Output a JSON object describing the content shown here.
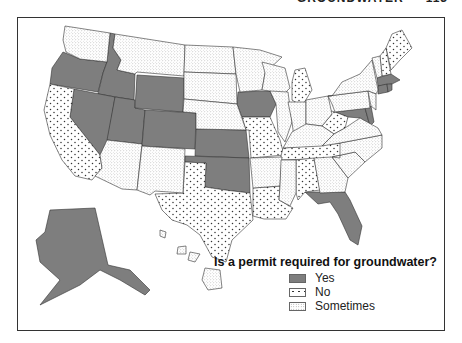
{
  "page_header": {
    "text": "GROUNDWATER",
    "page_number": "113"
  },
  "legend": {
    "title": "Is a permit required for groundwater?",
    "items": [
      {
        "key": "yes",
        "label": "Yes",
        "color": "#7e7e7e",
        "pattern": "solid"
      },
      {
        "key": "no",
        "label": "No",
        "color": "#333333",
        "pattern": "sparse-dots"
      },
      {
        "key": "sometimes",
        "label": "Sometimes",
        "color": "#999999",
        "pattern": "fine-stipple"
      }
    ]
  },
  "states": {
    "yes": [
      "OR",
      "ID",
      "NV",
      "UT",
      "WY",
      "CO",
      "KS",
      "OK",
      "IA",
      "FL",
      "AK",
      "MA",
      "CT",
      "RI",
      "MD",
      "DE"
    ],
    "no": [
      "CA",
      "TX",
      "MO",
      "LA",
      "TN",
      "AL",
      "WV",
      "MI",
      "ME",
      "NH"
    ],
    "sometimes": [
      "WA",
      "MT",
      "ND",
      "SD",
      "NE",
      "AZ",
      "NM",
      "MN",
      "WI",
      "IL",
      "IN",
      "OH",
      "KY",
      "AR",
      "MS",
      "GA",
      "SC",
      "NC",
      "VA",
      "PA",
      "NY",
      "NJ",
      "VT",
      "HI"
    ]
  }
}
